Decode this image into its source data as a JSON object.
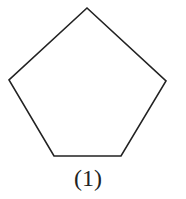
{
  "figure": {
    "shape": "regular-pentagon",
    "stroke_color": "#222222",
    "fill_color": "#ffffff",
    "vertices": [
      [
        87,
        8
      ],
      [
        166,
        81
      ],
      [
        121,
        156
      ],
      [
        54,
        156
      ],
      [
        9,
        80
      ]
    ],
    "caption": "(1)"
  }
}
